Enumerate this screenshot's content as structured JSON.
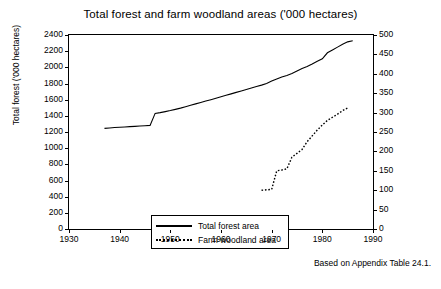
{
  "chart_data": {
    "type": "line",
    "title": "Total forest and farm woodland areas ('000 hectares)",
    "xlabel": "",
    "ylabel": "Total forest ('000 hectares)",
    "ylabel_right": "Farm woodland ('000 hectares)",
    "xlim": [
      1930,
      1990
    ],
    "ylim": [
      0,
      2400
    ],
    "ylim_right": [
      0,
      500
    ],
    "xticks": [
      "1930",
      "1940",
      "1950",
      "1960",
      "1970",
      "1980",
      "1990"
    ],
    "yticks": [
      "0",
      "200",
      "400",
      "600",
      "800",
      "1000",
      "1200",
      "1400",
      "1600",
      "1800",
      "2000",
      "2200",
      "2400"
    ],
    "yticks_right": [
      "0",
      "50",
      "100",
      "150",
      "200",
      "250",
      "300",
      "350",
      "400",
      "450",
      "500"
    ],
    "grid": false,
    "legend_position": "lower left inside",
    "annotation": "Based on Appendix Table 24.1.",
    "series": [
      {
        "name": "Total forest area",
        "axis": "left",
        "style": "solid",
        "x": [
          1937,
          1938,
          1939,
          1940,
          1941,
          1942,
          1943,
          1944,
          1945,
          1946,
          1947,
          1948,
          1949,
          1950,
          1951,
          1952,
          1953,
          1954,
          1955,
          1956,
          1957,
          1958,
          1959,
          1960,
          1961,
          1962,
          1963,
          1964,
          1965,
          1966,
          1967,
          1968,
          1969,
          1970,
          1971,
          1972,
          1973,
          1974,
          1975,
          1976,
          1977,
          1978,
          1979,
          1980,
          1981,
          1982,
          1983,
          1984,
          1985,
          1986
        ],
        "y": [
          1245,
          1250,
          1255,
          1258,
          1262,
          1266,
          1270,
          1274,
          1278,
          1282,
          1430,
          1440,
          1452,
          1465,
          1480,
          1495,
          1512,
          1530,
          1548,
          1565,
          1583,
          1600,
          1618,
          1636,
          1654,
          1672,
          1690,
          1708,
          1726,
          1744,
          1762,
          1780,
          1800,
          1830,
          1855,
          1880,
          1900,
          1925,
          1955,
          1985,
          2010,
          2040,
          2075,
          2105,
          2180,
          2215,
          2250,
          2285,
          2315,
          2330
        ]
      },
      {
        "name": "Farm woodland area",
        "axis": "right",
        "style": "dotted",
        "x": [
          1968,
          1969,
          1970,
          1971,
          1972,
          1973,
          1974,
          1975,
          1976,
          1977,
          1978,
          1979,
          1980,
          1981,
          1982,
          1983,
          1984,
          1985
        ],
        "y": [
          100,
          101,
          102,
          150,
          152,
          155,
          185,
          195,
          205,
          225,
          240,
          255,
          268,
          280,
          288,
          296,
          305,
          312
        ]
      }
    ]
  },
  "legend": {
    "items": [
      {
        "label": "Total forest area",
        "style": "solid"
      },
      {
        "label": "Farm woodland area",
        "style": "dotted"
      }
    ]
  }
}
